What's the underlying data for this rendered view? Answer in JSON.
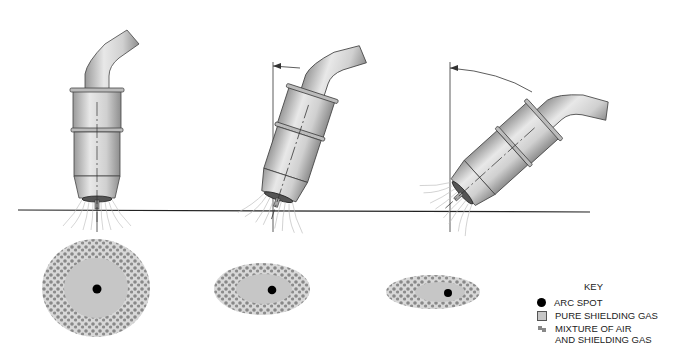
{
  "diagram": {
    "torches": [
      {
        "id": "torch-vertical",
        "angle_deg": 0,
        "pattern": "circular"
      },
      {
        "id": "torch-slight-tilt",
        "angle_deg": 15,
        "pattern": "oval"
      },
      {
        "id": "torch-steep-tilt",
        "angle_deg": 45,
        "pattern": "elongated-oval"
      }
    ],
    "colors": {
      "line": "#333333",
      "pure_gas": "#c6c6c6",
      "mixture": "#8a8a8a",
      "arc_spot": "#000000",
      "torch_body": "#d9d9d9"
    }
  },
  "key": {
    "title": "KEY",
    "items": [
      {
        "symbol": "dot",
        "label": "ARC SPOT"
      },
      {
        "symbol": "square",
        "label": "PURE SHIELDING GAS"
      },
      {
        "symbol": "mixture",
        "label": "MIXTURE OF AIR",
        "label2": "AND SHIELDING GAS"
      }
    ]
  }
}
